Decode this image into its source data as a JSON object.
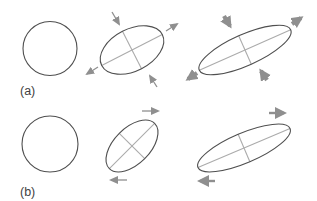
{
  "figure": {
    "panel_a_label": "(a)",
    "panel_b_label": "(b)"
  },
  "icons": {
    "panel_a": [
      "compression-arrow",
      "extension-arrow"
    ],
    "panel_b": [
      "shear-arrow"
    ]
  },
  "colors": {
    "background": "#ffffff",
    "shape_outline": "#4f4f4f",
    "axis_line": "#ababab",
    "arrow": "#8f8f8f",
    "label_text": "#3f3f3f"
  }
}
